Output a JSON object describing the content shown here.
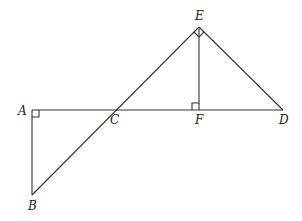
{
  "diagram": {
    "type": "geometry",
    "points": {
      "A": {
        "label": "A",
        "x": 32,
        "y": 110
      },
      "B": {
        "label": "B",
        "x": 32,
        "y": 195
      },
      "C": {
        "label": "C",
        "x": 115,
        "y": 110
      },
      "D": {
        "label": "D",
        "x": 283,
        "y": 110
      },
      "E": {
        "label": "E",
        "x": 199,
        "y": 27
      },
      "F": {
        "label": "F",
        "x": 199,
        "y": 110
      }
    },
    "segments": [
      "AD",
      "AB",
      "BE",
      "EF",
      "ED"
    ],
    "right_angles": [
      "A",
      "F",
      "E"
    ],
    "line_color": "#333333"
  }
}
